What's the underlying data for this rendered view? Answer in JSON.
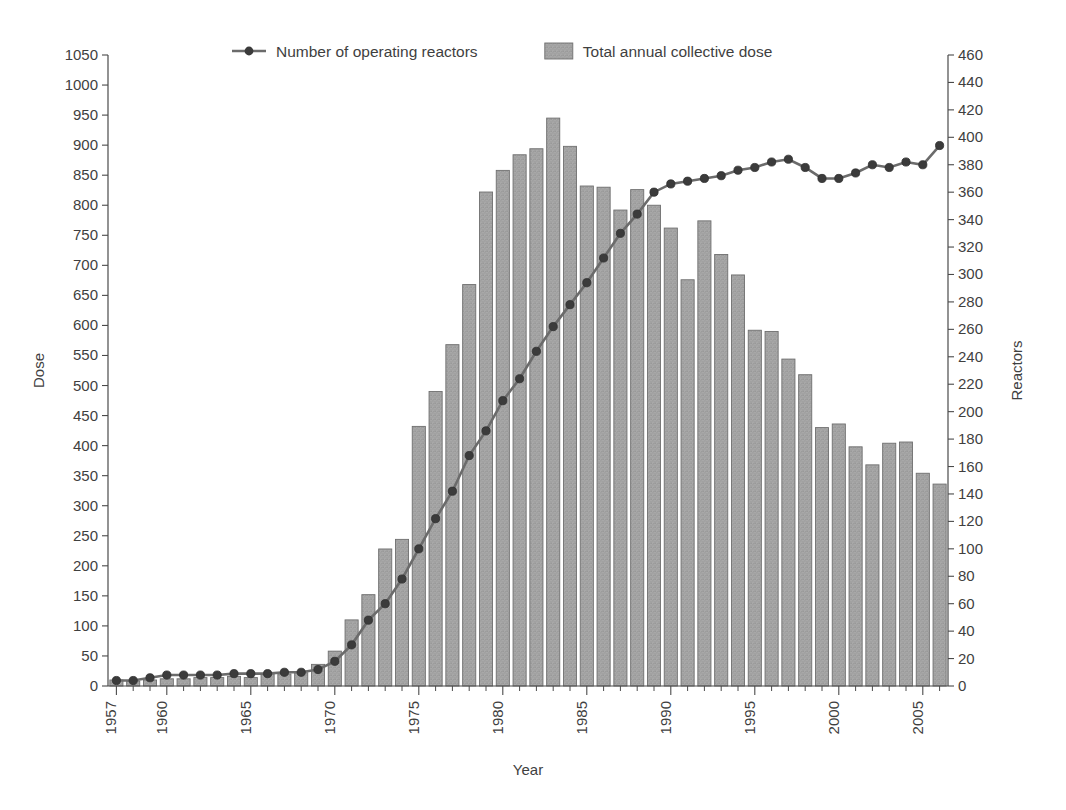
{
  "chart_data": {
    "type": "bar",
    "title": "",
    "xlabel": "Year",
    "ylabel": "Dose",
    "y2label": "Reactors",
    "xlim": [
      1956.5,
      2006.5
    ],
    "ylim": [
      0,
      1050
    ],
    "y2lim": [
      0,
      460
    ],
    "grid": false,
    "legend_position": "top-center",
    "x_tick_labels": [
      "1957",
      "1960",
      "1965",
      "1970",
      "1975",
      "1980",
      "1985",
      "1990",
      "1995",
      "2000",
      "2005"
    ],
    "x_tick_values": [
      1957,
      1960,
      1965,
      1970,
      1975,
      1980,
      1985,
      1990,
      1995,
      2000,
      2005
    ],
    "y_tick_labels": [
      "0",
      "50",
      "100",
      "150",
      "200",
      "250",
      "300",
      "350",
      "400",
      "450",
      "500",
      "550",
      "600",
      "650",
      "700",
      "750",
      "800",
      "850",
      "900",
      "950",
      "1000",
      "1050"
    ],
    "y_tick_values": [
      0,
      50,
      100,
      150,
      200,
      250,
      300,
      350,
      400,
      450,
      500,
      550,
      600,
      650,
      700,
      750,
      800,
      850,
      900,
      950,
      1000,
      1050
    ],
    "y2_tick_labels": [
      "0",
      "20",
      "40",
      "60",
      "80",
      "100",
      "120",
      "140",
      "160",
      "180",
      "200",
      "220",
      "240",
      "260",
      "280",
      "300",
      "320",
      "340",
      "360",
      "380",
      "400",
      "420",
      "440",
      "460"
    ],
    "y2_tick_values": [
      0,
      20,
      40,
      60,
      80,
      100,
      120,
      140,
      160,
      180,
      200,
      220,
      240,
      260,
      280,
      300,
      320,
      340,
      360,
      380,
      400,
      420,
      440,
      460
    ],
    "categories": [
      1957,
      1958,
      1959,
      1960,
      1961,
      1962,
      1963,
      1964,
      1965,
      1966,
      1967,
      1968,
      1969,
      1970,
      1971,
      1972,
      1973,
      1974,
      1975,
      1976,
      1977,
      1978,
      1979,
      1980,
      1981,
      1982,
      1983,
      1984,
      1985,
      1986,
      1987,
      1988,
      1989,
      1990,
      1991,
      1992,
      1993,
      1994,
      1995,
      1996,
      1997,
      1998,
      1999,
      2000,
      2001,
      2002,
      2003,
      2004,
      2005,
      2006
    ],
    "series": [
      {
        "name": "Total annual collective dose",
        "type": "bar",
        "axis": "left",
        "color": "#a8a8a8",
        "edge_color": "#6f6f6f",
        "values": [
          10,
          8,
          10,
          12,
          12,
          14,
          14,
          16,
          14,
          20,
          20,
          22,
          36,
          58,
          110,
          152,
          228,
          244,
          432,
          490,
          568,
          668,
          822,
          858,
          884,
          894,
          945,
          898,
          832,
          830,
          792,
          826,
          800,
          762,
          676,
          774,
          718,
          684,
          592,
          590,
          544,
          518,
          430,
          436,
          398,
          368,
          404,
          406,
          354,
          336
        ]
      },
      {
        "name": "Number of operating reactors",
        "type": "line",
        "axis": "right",
        "color": "#6b6b6b",
        "marker_color": "#3b3b3b",
        "values": [
          4,
          4,
          6,
          8,
          8,
          8,
          8,
          9,
          9,
          9,
          10,
          10,
          12,
          18,
          30,
          48,
          60,
          78,
          100,
          122,
          142,
          168,
          186,
          208,
          224,
          244,
          262,
          278,
          294,
          312,
          330,
          344,
          360,
          366,
          368,
          370,
          372,
          376,
          378,
          382,
          384,
          378,
          370,
          370,
          374,
          380,
          378,
          382,
          380,
          394
        ]
      }
    ],
    "legend": [
      {
        "label": "Number of operating reactors",
        "marker": "line-point",
        "color": "#6b6b6b"
      },
      {
        "label": "Total annual collective dose",
        "marker": "filled-rect",
        "color": "#a8a8a8"
      }
    ]
  },
  "figure": {
    "background": "#ffffff",
    "axis_color": "#4a4a4a",
    "text_color": "#3f3f3f"
  }
}
